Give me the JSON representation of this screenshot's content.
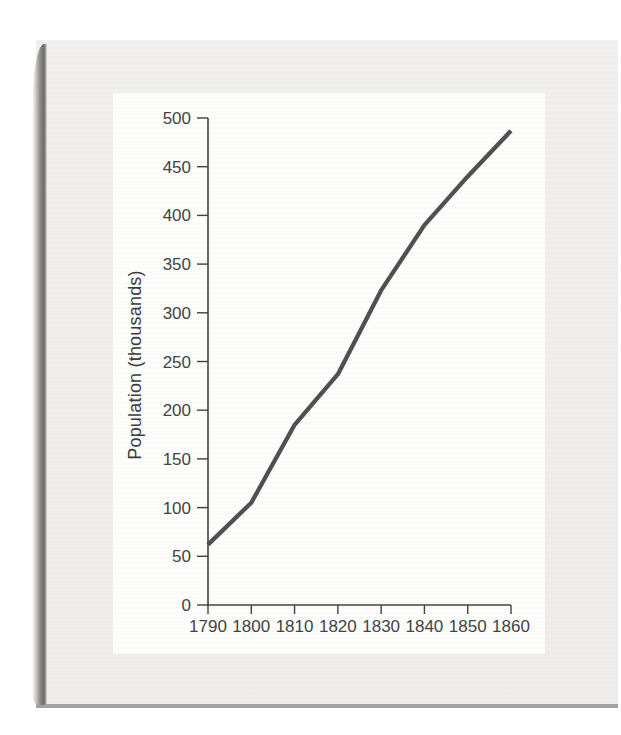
{
  "page": {
    "kind": "scanned-book-figure",
    "colors": {
      "page_bg": "#ffffff",
      "card_bg": "#efeeed",
      "panel_bg": "#fdfdfc",
      "binding_dark": "#6b6a68",
      "bottom_edge": "#a3a2a0",
      "axis": "#404040",
      "tick_text": "#424242",
      "line": "#4f4f4f"
    }
  },
  "chart_data": {
    "type": "line",
    "title": "",
    "xlabel": "",
    "ylabel": "Population (thousands)",
    "x": [
      1790,
      1800,
      1810,
      1820,
      1830,
      1840,
      1850,
      1860
    ],
    "values": [
      62,
      105,
      185,
      237,
      323,
      390,
      440,
      487
    ],
    "series_name": "Population",
    "xticks": [
      "1790",
      "1800",
      "1810",
      "1820",
      "1830",
      "1840",
      "1850",
      "1860"
    ],
    "yticks": [
      0,
      50,
      100,
      150,
      200,
      250,
      300,
      350,
      400,
      450,
      500
    ],
    "xlim": [
      1790,
      1860
    ],
    "ylim": [
      0,
      500
    ],
    "grid": false,
    "legend": "none",
    "line_width": 4.3
  }
}
